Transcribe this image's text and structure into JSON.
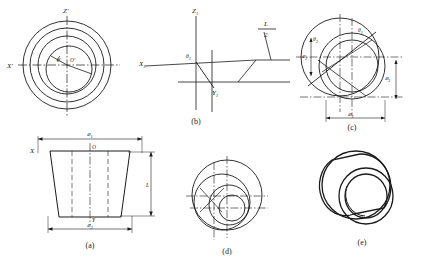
{
  "figure": {
    "type": "engineering-drawing",
    "title": "",
    "background_color": "#ffffff",
    "line_color": "#1a1a1a",
    "panels": [
      {
        "id": "top-left",
        "caption": "",
        "description": "concentric circles front view with rotated axes",
        "axis_labels": {
          "vertical": "Z'",
          "horizontal": "X'"
        },
        "angle_labels": [
          "θ'",
          "O'"
        ],
        "circle_count": 4
      },
      {
        "id": "b",
        "caption": "(b)",
        "axis_labels": {
          "vertical": "Z₁",
          "horizontal": "X₁",
          "oblique": "Y₁"
        },
        "angle_labels": [
          "θ₁"
        ],
        "dimension_labels": [
          "L",
          "2"
        ]
      },
      {
        "id": "c",
        "caption": "(c)",
        "angle_labels": [
          "θ₂",
          "θ₁"
        ],
        "dimension_labels": [
          "⌀₁",
          "⌀₂",
          "⌀₃"
        ],
        "circle_count": 4
      },
      {
        "id": "a",
        "caption": "(a)",
        "description": "frustum / truncated cone elevation",
        "dimension_labels": [
          "⌀₁",
          "⌀₂",
          "L"
        ],
        "axis_labels": {
          "left": "X",
          "center": "O",
          "bottom": "Y"
        }
      },
      {
        "id": "d",
        "caption": "(d)",
        "description": "overlapping circles with crosshair axes",
        "circle_count": 4
      },
      {
        "id": "e",
        "caption": "(e)",
        "description": "3D pictorial of tapered ring"
      }
    ],
    "captions": {
      "a": "(a)",
      "b": "(b)",
      "c": "(c)",
      "d": "(d)",
      "e": "(e)"
    },
    "labels": {
      "z_prime": "Z'",
      "x_prime": "X'",
      "theta_prime": "θ'",
      "o_prime": "O'",
      "z1": "Z",
      "z1_sub": "1",
      "x1": "X",
      "x1_sub": "1",
      "y1": "Y",
      "y1_sub": "1",
      "theta1": "θ",
      "theta1_sub": "1",
      "theta2": "θ",
      "theta2_sub": "2",
      "theta3": "θ",
      "theta3_sub": "3",
      "L": "L",
      "two": "2",
      "dia": "⌀",
      "dia1_sub": "1",
      "dia2_sub": "2",
      "dia3_sub": "3",
      "dia4_sub": "4",
      "X": "X",
      "O": "O",
      "Y": "Y",
      "Lq": "L"
    }
  }
}
